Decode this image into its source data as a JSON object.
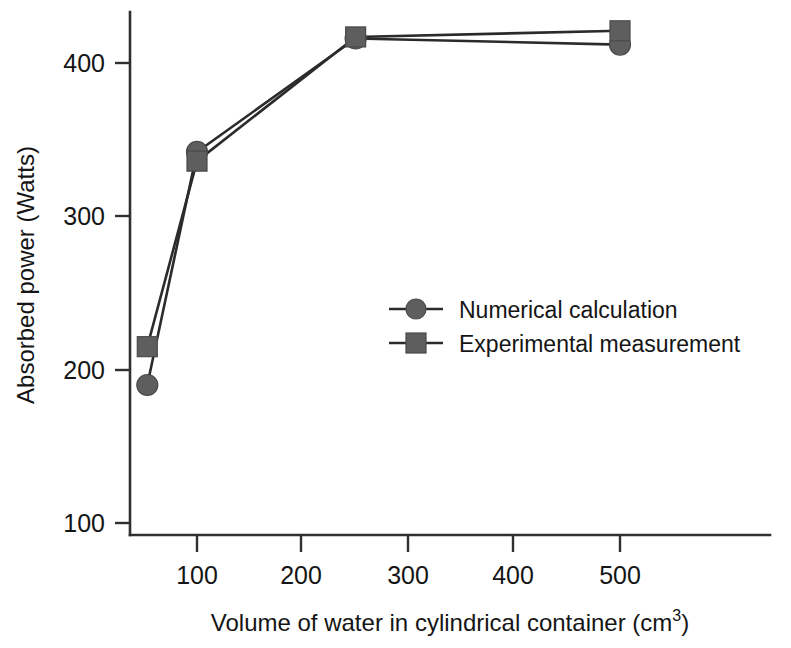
{
  "chart_data": {
    "type": "line",
    "title": "",
    "xlabel": "Volume of water in cylindrical container (cm3)",
    "xlabel_main": "Volume of water in cylindrical container (cm",
    "xlabel_sup": "3",
    "xlabel_tail": ")",
    "ylabel": "Absorbed power (Watts)",
    "xlim": [
      40,
      540
    ],
    "ylim": [
      100,
      440
    ],
    "xticks": [
      100,
      200,
      300,
      400,
      500
    ],
    "xtick_labels": [
      "100",
      "200",
      "300",
      "400",
      "500"
    ],
    "yticks": [
      100,
      200,
      300,
      400
    ],
    "ytick_labels": [
      "100",
      "200",
      "300",
      "400"
    ],
    "grid": false,
    "legend_position": "center-right",
    "x": [
      53,
      100,
      250,
      500
    ],
    "series": [
      {
        "name": "Numerical calculation",
        "marker": "circle",
        "color": "#5e5e5e",
        "values": [
          190,
          342,
          416,
          412
        ]
      },
      {
        "name": "Experimental measurement",
        "marker": "square",
        "color": "#5e5e5e",
        "values": [
          215,
          336,
          417,
          421
        ]
      }
    ]
  },
  "legend": {
    "items": [
      {
        "label": "Numerical calculation",
        "marker": "circle"
      },
      {
        "label": "Experimental measurement",
        "marker": "square"
      }
    ]
  },
  "axes": {
    "y_title": "Absorbed power (Watts)",
    "x_title_main": "Volume of water in cylindrical container (cm",
    "x_title_sup": "3",
    "x_title_tail": ")"
  }
}
